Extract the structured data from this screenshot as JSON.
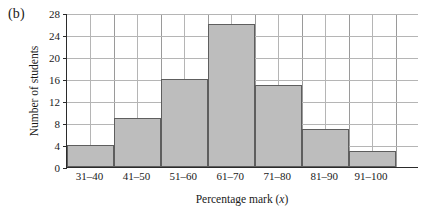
{
  "panel": {
    "label": "(b)"
  },
  "chart_data": {
    "type": "bar",
    "title": "",
    "subtitle": "",
    "xlabel": "Percentage mark (x)",
    "ylabel": "Number of students",
    "categories": [
      "31–40",
      "41–50",
      "51–60",
      "61–70",
      "71–80",
      "81–90",
      "91–100"
    ],
    "values": [
      4,
      9,
      16,
      26,
      15,
      7,
      3
    ],
    "ylim": [
      0,
      28
    ],
    "yticks": [
      0,
      4,
      8,
      12,
      16,
      20,
      24,
      28
    ],
    "ytick_labels": [
      "0",
      "4",
      "8",
      "12",
      "16",
      "20",
      "24",
      "28"
    ],
    "grid": true,
    "legend": "none",
    "bar_fill": "#bdbdbd",
    "bar_edge": "#5e5e5e",
    "grid_color": "#b5b5b5",
    "axis_color": "#2b2b2b",
    "n_columns": 15,
    "empty_trailing_columns": 1
  }
}
